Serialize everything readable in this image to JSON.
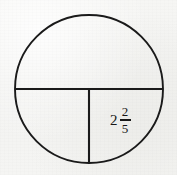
{
  "figure": {
    "kind": "fraction-circle-diagram",
    "background_color": "#f4f4f2",
    "stroke_color": "#1a1a1a",
    "text_color": "#171717",
    "circle": {
      "center_x": 89,
      "center_y": 89,
      "radius": 74,
      "stroke_width": 1.9
    },
    "partitions": [
      {
        "name": "horizontal-diameter",
        "x1": 15,
        "y1": 89,
        "x2": 163,
        "y2": 89,
        "stroke_width": 2.1
      },
      {
        "name": "vertical-radius-lower",
        "x1": 89,
        "y1": 89,
        "x2": 89,
        "y2": 163,
        "stroke_width": 2.1
      }
    ],
    "regions": [
      {
        "name": "top-semicircle",
        "label": ""
      },
      {
        "name": "bottom-left-quadrant",
        "label": ""
      },
      {
        "name": "bottom-right-quadrant",
        "label": "2 2/5"
      }
    ]
  },
  "label": {
    "name": "mixed-number-label",
    "text": "2 2/5",
    "whole": "2",
    "numerator": "2",
    "denominator": "5",
    "left": 110,
    "top": 105
  }
}
